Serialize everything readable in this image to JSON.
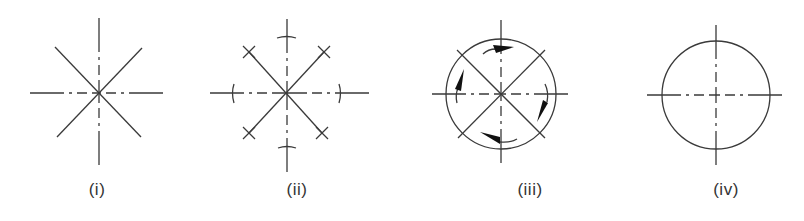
{
  "figure": {
    "colors": {
      "line": "#3a3a3a",
      "arrow": "#111111",
      "label": "#333333",
      "background": "#ffffff"
    }
  },
  "panels": [
    {
      "id": "i",
      "label": "(i)",
      "description": "Eight-ray star: dash-dot vertical and horizontal centre lines with two solid diagonals crossing at the centre"
    },
    {
      "id": "ii",
      "label": "(ii)",
      "description": "Eight-ray star with short arched tick marks on the vertical and horizontal centre lines and small X marks at the ends of the diagonals"
    },
    {
      "id": "iii",
      "label": "(iii)",
      "description": "Circle with dash-dot centre lines and solid diagonals, with four curved clockwise arrows inside the circle"
    },
    {
      "id": "iv",
      "label": "(iv)",
      "description": "Circle with dash-dot vertical and horizontal centre lines"
    }
  ]
}
